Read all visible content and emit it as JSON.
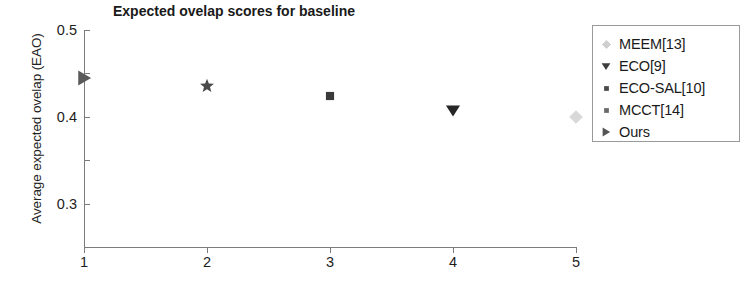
{
  "chart_data": {
    "type": "scatter",
    "title": "Expected ovelap scores for baseline",
    "xlabel": "",
    "ylabel": "Average expected ovelap (EAO)",
    "xlim": [
      1,
      5
    ],
    "ylim": [
      0,
      0.5
    ],
    "grid": false,
    "x": [
      1,
      2,
      3,
      4,
      5
    ],
    "xticklabels": [
      "1",
      "2",
      "3",
      "4",
      "5"
    ],
    "yticklabels": [
      "0",
      "0.1",
      "0.2",
      "0.3",
      "0.4",
      "0.5"
    ],
    "ytickvalues": [
      0,
      0.1,
      0.2,
      0.3,
      0.4,
      0.5
    ],
    "points": [
      {
        "x": 1,
        "y": 0.39,
        "marker": "right-triangle",
        "color": "#5a5a5a",
        "size": 17,
        "series": "Ours"
      },
      {
        "x": 2,
        "y": 0.37,
        "marker": "star",
        "color": "#4a4a4a",
        "size": 15,
        "series": "MCCT[14]"
      },
      {
        "x": 3,
        "y": 0.348,
        "marker": "square",
        "color": "#3a3a3a",
        "size": 12,
        "series": "ECO-SAL[10]"
      },
      {
        "x": 4,
        "y": 0.315,
        "marker": "down-triangle",
        "color": "#262626",
        "size": 16,
        "series": "ECO[9]"
      },
      {
        "x": 5,
        "y": 0.3,
        "marker": "diamond",
        "color": "#d8d8d8",
        "size": 14,
        "series": "MEEM[13]"
      }
    ],
    "legend": {
      "position": "right-outside",
      "entries": [
        {
          "label": "MEEM[13]",
          "marker": "diamond",
          "color": "#cfcfcf"
        },
        {
          "label": "ECO[9]",
          "marker": "down-triangle",
          "color": "#3d3d3d"
        },
        {
          "label": "ECO-SAL[10]",
          "marker": "square",
          "color": "#4a4a4a"
        },
        {
          "label": "MCCT[14]",
          "marker": "square",
          "color": "#6b6b6b"
        },
        {
          "label": "Ours",
          "marker": "right-triangle",
          "color": "#555555"
        }
      ]
    }
  }
}
